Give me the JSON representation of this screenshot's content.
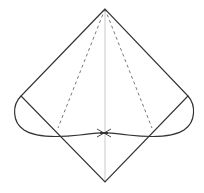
{
  "diagram": {
    "type": "origami-fold-diagram",
    "stroke_color": "#333333",
    "guide_color": "#aaaaaa",
    "dash_color": "#777777",
    "points": {
      "apex": [
        105,
        9
      ],
      "left": [
        21,
        96
      ],
      "right": [
        188,
        96
      ],
      "bottom": [
        105,
        182
      ],
      "knot": [
        104,
        133
      ],
      "left_dash_end": [
        58,
        128
      ],
      "right_dash_end": [
        152,
        128
      ]
    }
  }
}
